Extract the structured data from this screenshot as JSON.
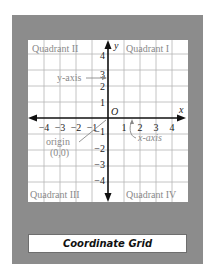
{
  "diagram": {
    "quadrants": {
      "q1": "Quadrant I",
      "q2": "Quadrant II",
      "q3": "Quadrant III",
      "q4": "Quadrant IV"
    },
    "axes": {
      "x_label": "x",
      "y_label": "y",
      "origin_label": "O",
      "x_ticks_negative": [
        "−4",
        "−3",
        "−2",
        "−1"
      ],
      "x_ticks_positive": [
        "1",
        "2",
        "3",
        "4"
      ],
      "y_ticks_positive": [
        "1",
        "2",
        "3",
        "4"
      ],
      "y_ticks_negative": [
        "−1",
        "−2",
        "−3",
        "−4"
      ]
    },
    "annotations": {
      "y_axis_callout": "y-axis",
      "x_axis_callout": "x-axis",
      "origin_callout": "origin",
      "origin_coords": "(0,0)"
    },
    "colors": {
      "frame": "#8c8c8c",
      "grid_line": "#b5b5b5",
      "axis": "#111111",
      "label_text": "#888888"
    }
  },
  "caption": {
    "title": "Coordinate Grid"
  }
}
